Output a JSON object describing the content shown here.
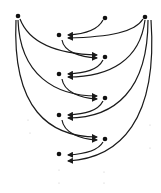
{
  "diagram": {
    "type": "directed-graph",
    "colors": {
      "edge": "#1a1a1a",
      "node": "#111111",
      "background": "#ffffff"
    },
    "nodes": [
      {
        "id": "L",
        "x": 18,
        "y": 16
      },
      {
        "id": "T",
        "x": 105,
        "y": 18
      },
      {
        "id": "R",
        "x": 145,
        "y": 17
      },
      {
        "id": "A1",
        "x": 59,
        "y": 35
      },
      {
        "id": "B1",
        "x": 105,
        "y": 57
      },
      {
        "id": "A2",
        "x": 59,
        "y": 74
      },
      {
        "id": "B2",
        "x": 105,
        "y": 98
      },
      {
        "id": "A3",
        "x": 59,
        "y": 115
      },
      {
        "id": "B3",
        "x": 105,
        "y": 139
      },
      {
        "id": "A4",
        "x": 59,
        "y": 154
      }
    ],
    "edges": [
      {
        "from": "T",
        "to": "A1",
        "d": "M103,20 C98,30 85,34 68,35"
      },
      {
        "from": "R",
        "to": "A1",
        "d": "M143,19 C135,32 110,37 68,38"
      },
      {
        "from": "L",
        "to": "B1",
        "d": "M20,19 C30,45 60,54 97,55"
      },
      {
        "from": "A1",
        "to": "B1",
        "d": "M62,40 C64,52 80,57 97,58"
      },
      {
        "from": "B1",
        "to": "A2",
        "d": "M103,60 C98,70 85,73 68,74"
      },
      {
        "from": "R",
        "to": "A2",
        "d": "M145,20 C140,60 110,77 68,77"
      },
      {
        "from": "L",
        "to": "B2",
        "d": "M18,20 C20,75 55,96 97,96"
      },
      {
        "from": "A2",
        "to": "B2",
        "d": "M62,79 C64,92 80,98 97,99"
      },
      {
        "from": "B2",
        "to": "A3",
        "d": "M103,101 C98,111 85,114 68,115"
      },
      {
        "from": "R",
        "to": "A3",
        "d": "M148,20 C148,90 115,118 68,118"
      },
      {
        "from": "L",
        "to": "B3",
        "d": "M16,20 C12,110 50,137 97,137"
      },
      {
        "from": "A3",
        "to": "B3",
        "d": "M62,120 C64,133 80,139 97,140"
      },
      {
        "from": "B3",
        "to": "A4",
        "d": "M103,142 C98,151 85,154 68,155"
      },
      {
        "from": "R",
        "to": "A4",
        "d": "M151,20 C158,120 120,158 68,161"
      }
    ]
  }
}
